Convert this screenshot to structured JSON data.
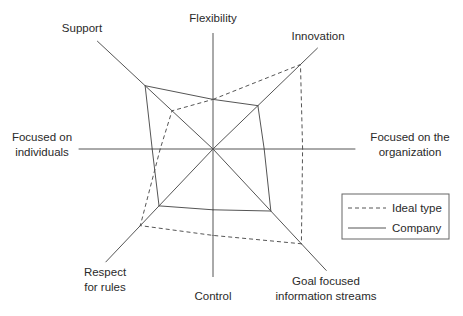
{
  "chart_data": {
    "type": "radar",
    "title": "",
    "axes": [
      {
        "key": "flexibility",
        "label": [
          "Flexibility"
        ],
        "angle_deg": 90,
        "extent": 7.25
      },
      {
        "key": "innovation",
        "label": [
          "Innovation"
        ],
        "angle_deg": 44,
        "extent": 9.1
      },
      {
        "key": "organization",
        "label": [
          "Focused on the",
          "organization"
        ],
        "angle_deg": 0,
        "extent": 8.9
      },
      {
        "key": "goal",
        "label": [
          "Goal focused",
          "information streams"
        ],
        "angle_deg": -47,
        "extent": 10.4
      },
      {
        "key": "control",
        "label": [
          "Control"
        ],
        "angle_deg": -90,
        "extent": 8.0
      },
      {
        "key": "respect",
        "label": [
          "Respect",
          "for rules"
        ],
        "angle_deg": -133.5,
        "extent": 9.75
      },
      {
        "key": "individuals",
        "label": [
          "Focused on",
          "individuals"
        ],
        "angle_deg": 180,
        "extent": 8.4
      },
      {
        "key": "support",
        "label": [
          "Support"
        ],
        "angle_deg": 137,
        "extent": 9.9
      }
    ],
    "series": [
      {
        "name": "Ideal type",
        "style": "dashed",
        "values": [
          3.1,
          7.6,
          5.6,
          8.1,
          5.4,
          6.6,
          3.3,
          3.5
        ]
      },
      {
        "name": "Company",
        "style": "solid",
        "values": [
          3.1,
          3.9,
          3.2,
          5.3,
          3.8,
          4.9,
          3.8,
          5.8
        ]
      }
    ],
    "legend": {
      "position": "right",
      "entries": [
        "Ideal type",
        "Company"
      ]
    },
    "grid": false,
    "line_color": "#555555"
  }
}
